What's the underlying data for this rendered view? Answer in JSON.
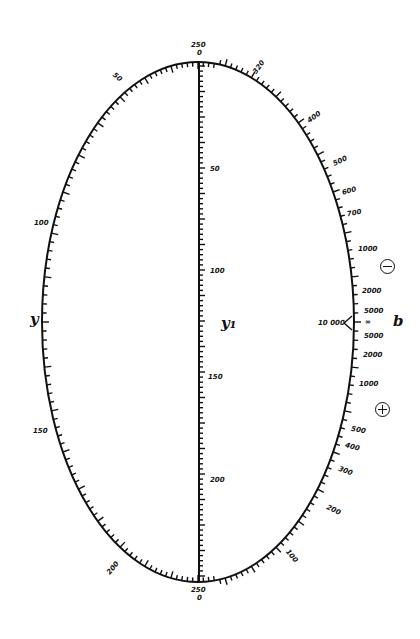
{
  "diagram": {
    "type": "elliptic nomogram",
    "colors": {
      "ink": "#111111",
      "background": "#ffffff"
    },
    "ellipse": {
      "cx": 198,
      "cy": 322,
      "rx": 156,
      "ry": 260
    },
    "axis_labels": {
      "y": "y",
      "y1": "y₁",
      "b": "b"
    },
    "signs": {
      "minus": "−",
      "plus": "+"
    },
    "left_scale_y": {
      "name": "y",
      "labels": [
        "250",
        "50",
        "100",
        "150",
        "200",
        "250"
      ]
    },
    "center_scale_y1": {
      "name": "y₁",
      "top_label": "250",
      "top_zero": "0",
      "labels": [
        "50",
        "100",
        "150",
        "200"
      ],
      "bottom_label": "250",
      "bottom_zero": "0"
    },
    "right_scale_b": {
      "name": "b",
      "upper_negative": [
        "320",
        "400",
        "500",
        "600",
        "700",
        "1000",
        "2000",
        "5000"
      ],
      "center_labels": [
        "10 000",
        "∞"
      ],
      "lower_positive": [
        "5000",
        "2000",
        "1000",
        "500",
        "400",
        "300",
        "200",
        "100"
      ]
    }
  }
}
